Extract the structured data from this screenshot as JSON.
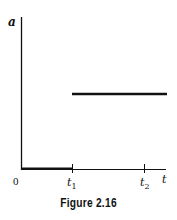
{
  "figure": {
    "caption": "Figure 2.16",
    "y_axis_label": "a",
    "x_axis_label": "t",
    "origin_label": "0",
    "ticks": [
      {
        "label": "t",
        "subscript": "1"
      },
      {
        "label": "t",
        "subscript": "2"
      }
    ]
  },
  "colors": {
    "ink": "#111111",
    "background": "#ffffff"
  }
}
